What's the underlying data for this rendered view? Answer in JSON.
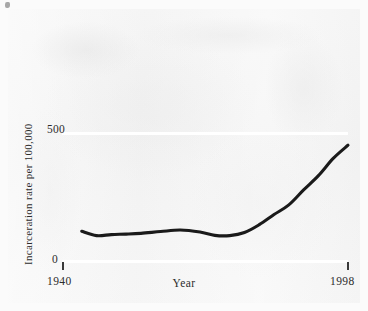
{
  "figure": {
    "background_color": "#f2f2f2",
    "page_color": "#fbfbfb",
    "line_color": "#1a1a1a",
    "gridline_color": "#ffffff",
    "text_color": "#2c2c2c"
  },
  "chart_data": {
    "type": "line",
    "title": "",
    "subtitle": "",
    "xlabel": "Year",
    "ylabel": "Incarceration rate per 100,000",
    "xlim": [
      1940,
      1998
    ],
    "ylim": [
      0,
      500
    ],
    "xticks": [
      1940,
      1998
    ],
    "xtick_labels": [
      "1940",
      "1998"
    ],
    "yticks": [
      0,
      500
    ],
    "ytick_labels": [
      "0",
      "500"
    ],
    "grid": true,
    "grid_axis": "y",
    "legend": false,
    "legend_position": "none",
    "annotations": [],
    "series": [
      {
        "name": "Incarceration rate per 100,000",
        "x": [
          1944,
          1947,
          1950,
          1953,
          1956,
          1960,
          1964,
          1968,
          1971,
          1974,
          1977,
          1980,
          1983,
          1986,
          1989,
          1992,
          1995,
          1998
        ],
        "values": [
          113,
          96,
          100,
          102,
          105,
          112,
          118,
          110,
          97,
          96,
          108,
          139,
          179,
          217,
          276,
          332,
          400,
          452
        ]
      }
    ]
  },
  "labels": {
    "y_500": "500",
    "y_0": "0",
    "x_start": "1940",
    "x_end": "1998",
    "x_title": "Year",
    "y_title": "Incarceration rate per 100,000"
  }
}
